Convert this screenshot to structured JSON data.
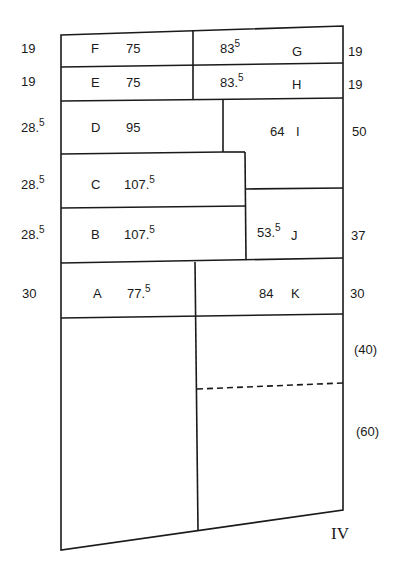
{
  "diagram": {
    "sheet_label": "IV",
    "plots": [
      {
        "id": "F",
        "value": "75"
      },
      {
        "id": "E",
        "value": "75"
      },
      {
        "id": "D",
        "value": "95"
      },
      {
        "id": "C",
        "value": "107.5",
        "value_main": "107",
        "value_sup": "5"
      },
      {
        "id": "B",
        "value": "107.5",
        "value_main": "107",
        "value_sup": "5"
      },
      {
        "id": "A",
        "value": "77.5",
        "value_main": "77",
        "value_sup": "5"
      },
      {
        "id": "G",
        "value": "83.5",
        "value_main": "83",
        "value_sup": "5"
      },
      {
        "id": "H",
        "value": "83.5",
        "value_main": "83",
        "value_sup": "5"
      },
      {
        "id": "I",
        "value": "64"
      },
      {
        "id": "J",
        "value": "53.5",
        "value_main": "53",
        "value_sup": "5"
      },
      {
        "id": "K",
        "value": "84"
      }
    ],
    "left_widths": [
      {
        "value": "19"
      },
      {
        "value": "19"
      },
      {
        "value": "28.5",
        "main": "28",
        "sup": "5"
      },
      {
        "value": "28.5",
        "main": "28",
        "sup": "5"
      },
      {
        "value": "28.5",
        "main": "28",
        "sup": "5"
      },
      {
        "value": "30"
      }
    ],
    "right_widths": [
      {
        "value": "19"
      },
      {
        "value": "19"
      },
      {
        "value": "50"
      },
      {
        "value": "37"
      },
      {
        "value": "30"
      },
      {
        "value": "(40)"
      },
      {
        "value": "(60)"
      }
    ]
  }
}
